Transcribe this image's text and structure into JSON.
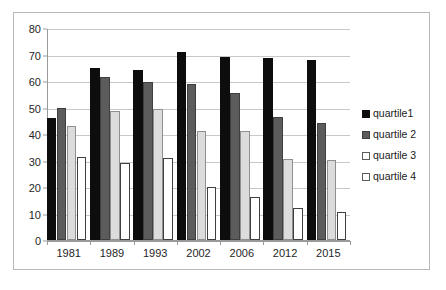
{
  "chart_data": {
    "type": "bar",
    "title": "",
    "subtitle": "",
    "xlabel": "",
    "ylabel": "",
    "ylim": [
      0,
      80
    ],
    "ytick_step": 10,
    "yticks": [
      0,
      10,
      20,
      30,
      40,
      50,
      60,
      70,
      80
    ],
    "grid": true,
    "grid_axis": "y",
    "legend_position": "right",
    "categories": [
      "1981",
      "1989",
      "1993",
      "2002",
      "2006",
      "2012",
      "2015"
    ],
    "series": [
      {
        "name": "quartile1",
        "color": "#0d0d0d",
        "values": [
          46,
          65,
          64,
          70.8,
          69,
          68.8,
          68
        ]
      },
      {
        "name": "quartile 2",
        "color": "#5c5c5c",
        "values": [
          50,
          61.5,
          59.5,
          59,
          55.3,
          46.6,
          44
        ]
      },
      {
        "name": "quartile 3",
        "color": "#dcdcdc",
        "values": [
          43,
          48.5,
          49.5,
          41,
          41,
          30.5,
          30.2
        ]
      },
      {
        "name": "quartile 4",
        "color": "#ffffff",
        "values": [
          31.5,
          29,
          31,
          20,
          16.2,
          12.2,
          10.4
        ]
      }
    ]
  },
  "legend": {
    "items": [
      {
        "label": "quartile1",
        "swatch": "black-square-icon"
      },
      {
        "label": "quartile 2",
        "swatch": "gray-square-icon"
      },
      {
        "label": "quartile 3",
        "swatch": "white-square-icon"
      },
      {
        "label": "quartile 4",
        "swatch": "white-square-icon"
      }
    ]
  },
  "colors": {
    "quartile1": "#0d0d0d",
    "quartile2": "#5c5c5c",
    "quartile3": "#dcdcdc",
    "quartile4": "#ffffff",
    "gridline": "#c8c8c8",
    "axis": "#9a9a9a",
    "frame": "#b9b9b9",
    "text": "#262626",
    "background": "#ffffff"
  }
}
